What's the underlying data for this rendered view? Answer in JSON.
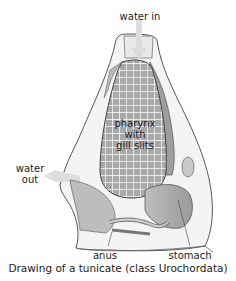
{
  "diagram": {
    "labels": {
      "water_in": "water in",
      "pharynx_line1": "pharynx",
      "pharynx_line2": "with",
      "pharynx_line3": "gill slits",
      "water_out_line1": "water",
      "water_out_line2": "out",
      "anus": "anus",
      "stomach": "stomach"
    },
    "caption": "Drawing of a tunicate (class Urochordata)",
    "colors": {
      "body_outline": "#555555",
      "tunic_fill": "#f2f2f2",
      "pharynx_fill": "#a8a8a8",
      "gill_grid": "#ffffff",
      "organ_fill": "#b5b5b5",
      "arrow_fill": "#dcdcdc"
    }
  }
}
